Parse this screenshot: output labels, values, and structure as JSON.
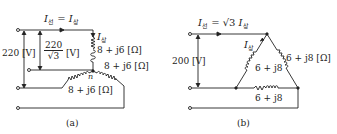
{
  "diagram_a": {
    "caption": "(a)",
    "line_current_label": "I",
    "line_sub": "선",
    "equals": " = ",
    "phase_current_label": "I",
    "phase_sub": "상",
    "line_voltage": "220 [V]",
    "phase_voltage_num": "220",
    "phase_voltage_den": "√3",
    "phase_voltage_unit": "[V]",
    "impedance_top": "8 + j6 [Ω]",
    "impedance_right": "8 + j6 [Ω]",
    "impedance_left": "8 + j6 [Ω]",
    "neutral_label": "n"
  },
  "diagram_b": {
    "caption": "(b)",
    "line_current_label": "I",
    "line_sub": "선",
    "equals": " = √3 ",
    "phase_current_label": "I",
    "phase_sub": "상",
    "line_voltage": "200 [V]",
    "impedance_right": "6 + j8 [Ω]",
    "impedance_left": "6 + j8",
    "impedance_bottom": "6 + j8"
  },
  "colors": {
    "line": "#222222",
    "background": "#ffffff"
  }
}
